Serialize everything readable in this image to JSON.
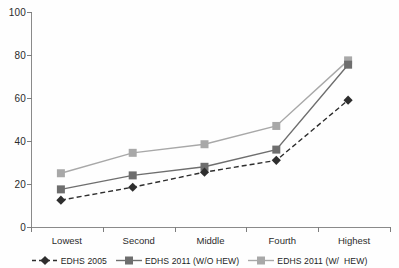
{
  "chart_data": {
    "type": "line",
    "title": "",
    "xlabel": "",
    "ylabel": "",
    "categories": [
      "Lowest",
      "Second",
      "Middle",
      "Fourth",
      "Highest"
    ],
    "ylim": [
      0,
      100
    ],
    "yticks": [
      0,
      20,
      40,
      60,
      80,
      100
    ],
    "grid": false,
    "legend_position": "bottom",
    "series": [
      {
        "name": "EDHS 2005",
        "values": [
          12.5,
          18.5,
          25.5,
          31,
          59
        ],
        "color": "#2e2e2e",
        "marker": "diamond",
        "line_style": "dashed"
      },
      {
        "name": "EDHS 2011 (W/O HEW)",
        "values": [
          17.5,
          24,
          28,
          36,
          75.5
        ],
        "color": "#6e6e6e",
        "marker": "square",
        "line_style": "solid"
      },
      {
        "name": "EDHS 2011 (W/  HEW)",
        "values": [
          25,
          34.5,
          38.5,
          47,
          77.5
        ],
        "color": "#a8a8a8",
        "marker": "square",
        "line_style": "solid"
      }
    ]
  },
  "axis": {
    "y_labels": [
      "100",
      "80",
      "60",
      "40",
      "20",
      "0"
    ],
    "x_labels": [
      "Lowest",
      "Second",
      "Middle",
      "Fourth",
      "Highest"
    ]
  },
  "legend": {
    "items": [
      {
        "label": "EDHS 2005"
      },
      {
        "label": "EDHS 2011 (W/O HEW)"
      },
      {
        "label": "EDHS 2011 (W/  HEW)"
      }
    ]
  }
}
